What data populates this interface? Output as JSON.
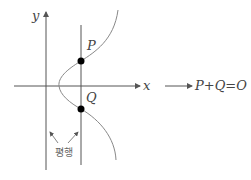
{
  "diagram": {
    "axis_labels": {
      "x": "x",
      "y": "y"
    },
    "points": [
      {
        "name": "P",
        "label": "P"
      },
      {
        "name": "Q",
        "label": "Q"
      }
    ],
    "annotation": "평행",
    "result": "P+Q=O",
    "colors": {
      "stroke": "#555555",
      "curve": "#888888",
      "point": "#000000",
      "text": "#444444"
    }
  }
}
